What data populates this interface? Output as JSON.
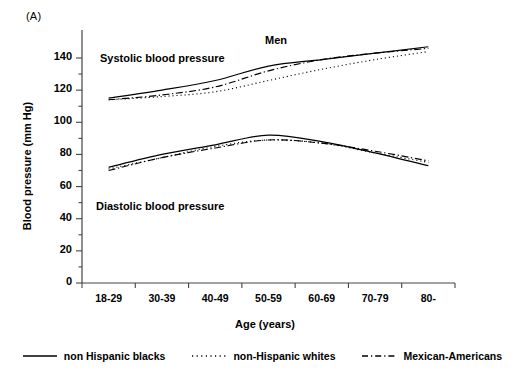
{
  "panel": {
    "label": "(A)"
  },
  "annotations": {
    "group_title": "Men",
    "systolic": "Systolic blood pressure",
    "diastolic": "Diastolic blood pressure"
  },
  "axes": {
    "y_title": "Blood pressure (mm Hg)",
    "x_title": "Age (years)",
    "y_ticks": [
      "0",
      "20",
      "40",
      "60",
      "80",
      "100",
      "120",
      "140"
    ],
    "x_ticks": [
      "18-29",
      "30-39",
      "40-49",
      "50-59",
      "60-69",
      "70-79",
      "80-"
    ]
  },
  "legend": {
    "items": [
      {
        "label": "non Hispanic blacks",
        "style": "solid"
      },
      {
        "label": "non-Hispanic whites",
        "style": "dotted"
      },
      {
        "label": "Mexican-Americans",
        "style": "dash-dot"
      }
    ]
  },
  "colors": {
    "ink": "#000000",
    "axis": "#555555"
  },
  "chart_data": {
    "type": "line",
    "title": "Men",
    "xlabel": "Age (years)",
    "ylabel": "Blood pressure (mm Hg)",
    "categories": [
      "18-29",
      "30-39",
      "40-49",
      "50-59",
      "60-69",
      "70-79",
      "80-"
    ],
    "ylim": [
      0,
      150
    ],
    "ytick_step": 20,
    "yminor_step": 10,
    "grid": false,
    "legend_position": "bottom",
    "series": [
      {
        "name": "non Hispanic blacks",
        "style": "solid",
        "measure": "Systolic blood pressure",
        "values": [
          115,
          120,
          126,
          135,
          139,
          143,
          147
        ]
      },
      {
        "name": "non-Hispanic whites",
        "style": "dotted",
        "measure": "Systolic blood pressure",
        "values": [
          114,
          116,
          119,
          126,
          133,
          139,
          144
        ]
      },
      {
        "name": "Mexican-Americans",
        "style": "dash-dot",
        "measure": "Systolic blood pressure",
        "values": [
          114,
          117,
          122,
          132,
          139,
          143,
          146
        ]
      },
      {
        "name": "non Hispanic blacks",
        "style": "solid",
        "measure": "Diastolic blood pressure",
        "values": [
          72,
          80,
          86,
          92,
          88,
          81,
          73
        ]
      },
      {
        "name": "non-Hispanic whites",
        "style": "dotted",
        "measure": "Diastolic blood pressure",
        "values": [
          71,
          78,
          85,
          89,
          87,
          81,
          75
        ]
      },
      {
        "name": "Mexican-Americans",
        "style": "dash-dot",
        "measure": "Diastolic blood pressure",
        "values": [
          70,
          78,
          84,
          89,
          87,
          82,
          76
        ]
      }
    ]
  }
}
